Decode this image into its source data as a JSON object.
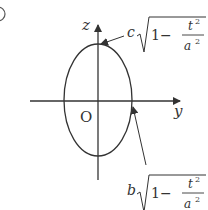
{
  "figure": {
    "problem_marker": "①",
    "axes": {
      "horizontal_label": "y",
      "vertical_label": "z",
      "origin_label": "O"
    },
    "curve": "ellipse",
    "top_annotation": {
      "coef": "c",
      "one": "1",
      "minus": "−",
      "num_var": "t",
      "num_exp": "2",
      "den_var": "a",
      "den_exp": "2"
    },
    "side_annotation": {
      "coef": "b",
      "one": "1",
      "minus": "−",
      "num_var": "t",
      "num_exp": "2",
      "den_var": "a",
      "den_exp": "2"
    },
    "colors": {
      "stroke": "#333333",
      "background": "#ffffff"
    }
  }
}
